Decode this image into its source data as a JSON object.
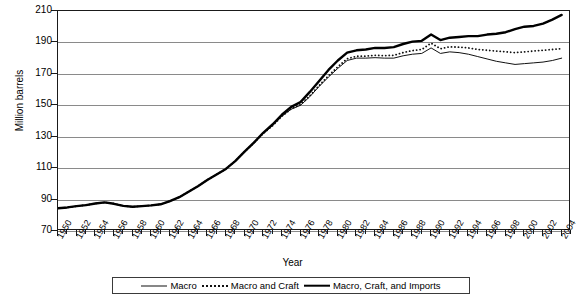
{
  "chart_data": {
    "type": "line",
    "title": "",
    "xlabel": "Year",
    "ylabel": "Million barrels",
    "ylim": [
      70,
      210
    ],
    "ytick_step": 20,
    "yticks": [
      70,
      90,
      110,
      130,
      150,
      170,
      190,
      210
    ],
    "xlim": [
      1950,
      2005
    ],
    "xtick_step": 1,
    "xlabel_step": 2,
    "grid": "horizontal",
    "legend_position": "bottom",
    "x": [
      1950,
      1951,
      1952,
      1953,
      1954,
      1955,
      1956,
      1957,
      1958,
      1959,
      1960,
      1961,
      1962,
      1963,
      1964,
      1965,
      1966,
      1967,
      1968,
      1969,
      1970,
      1971,
      1972,
      1973,
      1974,
      1975,
      1976,
      1977,
      1978,
      1979,
      1980,
      1981,
      1982,
      1983,
      1984,
      1985,
      1986,
      1987,
      1988,
      1989,
      1990,
      1991,
      1992,
      1993,
      1994,
      1995,
      1996,
      1997,
      1998,
      1999,
      2000,
      2001,
      2002,
      2003,
      2004
    ],
    "xtick_labels": [
      "1950",
      "1952",
      "1954",
      "1956",
      "1958",
      "1960",
      "1962",
      "1964",
      "1966",
      "1968",
      "1970",
      "1972",
      "1974",
      "1976",
      "1978",
      "1980",
      "1982",
      "1984",
      "1986",
      "1988",
      "1990",
      "1992",
      "1994",
      "1996",
      "1998",
      "2000",
      "2002",
      "2004"
    ],
    "series": [
      {
        "name": "Macro",
        "style": "thin-solid",
        "color": "#111111",
        "values": [
          84.5,
          85.0,
          85.8,
          86.5,
          87.5,
          88.2,
          87.3,
          86.0,
          85.4,
          85.8,
          86.3,
          87.0,
          89.0,
          91.5,
          95.0,
          98.5,
          102.5,
          106.0,
          109.5,
          114.5,
          120.5,
          126.0,
          132.0,
          137.0,
          143.0,
          147.5,
          150.0,
          155.5,
          162.0,
          168.0,
          173.5,
          178.5,
          180.0,
          180.0,
          180.3,
          180.0,
          180.0,
          181.5,
          182.5,
          183.0,
          186.5,
          183.0,
          184.0,
          183.5,
          182.5,
          181.0,
          179.5,
          178.0,
          177.0,
          176.0,
          176.5,
          177.0,
          177.5,
          178.5,
          180.0
        ]
      },
      {
        "name": "Macro and Craft",
        "style": "dotted",
        "color": "#111111",
        "values": [
          84.5,
          85.0,
          85.8,
          86.5,
          87.5,
          88.2,
          87.3,
          86.0,
          85.4,
          85.8,
          86.3,
          87.0,
          89.0,
          91.5,
          95.0,
          98.5,
          102.5,
          106.0,
          109.5,
          114.5,
          120.5,
          126.0,
          132.0,
          137.0,
          143.0,
          147.8,
          150.4,
          156.0,
          162.6,
          168.8,
          174.5,
          179.6,
          181.2,
          181.3,
          181.8,
          181.6,
          181.8,
          183.5,
          184.8,
          185.5,
          189.5,
          186.0,
          187.2,
          187.0,
          186.5,
          185.5,
          185.0,
          184.5,
          184.0,
          183.5,
          184.0,
          184.5,
          185.0,
          185.5,
          186.0
        ]
      },
      {
        "name": "Macro, Craft, and Imports",
        "style": "thick-solid",
        "color": "#000000",
        "values": [
          84.5,
          85.0,
          85.8,
          86.5,
          87.5,
          88.2,
          87.3,
          86.0,
          85.4,
          85.8,
          86.3,
          87.0,
          89.0,
          91.5,
          95.0,
          98.5,
          102.5,
          106.0,
          109.5,
          114.5,
          120.5,
          126.2,
          132.5,
          137.8,
          144.0,
          149.0,
          152.0,
          158.5,
          165.5,
          172.5,
          178.5,
          183.5,
          185.0,
          185.5,
          186.5,
          186.5,
          187.0,
          189.0,
          190.5,
          191.0,
          195.0,
          191.5,
          193.0,
          193.5,
          194.0,
          194.0,
          195.0,
          195.5,
          196.5,
          198.5,
          200.0,
          200.5,
          202.0,
          204.5,
          207.5
        ]
      }
    ]
  },
  "legend": {
    "items": [
      {
        "label": "Macro"
      },
      {
        "label": "Macro and Craft"
      },
      {
        "label": "Macro, Craft, and Imports"
      }
    ]
  }
}
